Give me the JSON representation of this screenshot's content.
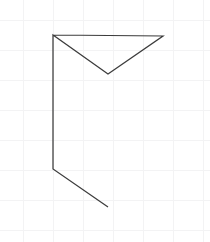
{
  "canvas": {
    "width": 210,
    "height": 242,
    "background_color": "#ffffff",
    "label": "line drawing canvas"
  },
  "grid": {
    "visible": true,
    "color": "#f3f3f4",
    "spacing": 30,
    "origin_x": 23,
    "origin_y": 20,
    "x_positions": [
      23,
      53,
      83,
      113,
      143,
      173,
      203
    ],
    "y_positions": [
      20,
      50,
      80,
      110,
      140,
      170,
      200,
      230
    ],
    "stroke_width": 1
  },
  "drawing": {
    "title": "open polyline arrow shape",
    "stroke_color": "#3c3c3c",
    "stroke_width": 1.25,
    "fill": "none",
    "points": [
      {
        "name": "top-left-corner",
        "x": 53,
        "y": 35
      },
      {
        "name": "top-right-corner",
        "x": 163,
        "y": 36
      },
      {
        "name": "v-notch-bottom",
        "x": 108,
        "y": 74
      },
      {
        "name": "top-left-corner-return",
        "x": 53,
        "y": 35
      },
      {
        "name": "left-bottom-bend",
        "x": 53,
        "y": 169
      },
      {
        "name": "diagonal-end",
        "x": 108,
        "y": 207
      }
    ],
    "path_d": "M 53 35 L 163 36 L 108 74 L 53 35 L 53 169 L 108 207",
    "segments": [
      {
        "name": "top-horizontal-edge",
        "from": "top-left-corner",
        "to": "top-right-corner"
      },
      {
        "name": "right-diagonal-edge",
        "from": "top-right-corner",
        "to": "v-notch-bottom"
      },
      {
        "name": "left-diagonal-edge",
        "from": "v-notch-bottom",
        "to": "top-left-corner"
      },
      {
        "name": "left-vertical-edge",
        "from": "top-left-corner",
        "to": "left-bottom-bend"
      },
      {
        "name": "bottom-diagonal-tail",
        "from": "left-bottom-bend",
        "to": "diagonal-end"
      }
    ]
  }
}
